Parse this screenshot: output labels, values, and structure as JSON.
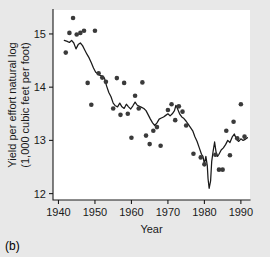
{
  "caption": "(b)",
  "chart_data": {
    "type": "scatter",
    "title": "",
    "xlabel": "Year",
    "ylabel": "Yield per effort natural log\n(1,000 cubic feet per foot)",
    "ylabel_line1": "Yield per effort natural log",
    "ylabel_line2": "(1,000 cubic feet per foot)",
    "xlim": [
      1938.5,
      1992.5
    ],
    "ylim": [
      11.88,
      15.45
    ],
    "xticks": [
      1940,
      1950,
      1960,
      1970,
      1980,
      1990
    ],
    "xtick_labels": [
      "1940",
      "1950",
      "1960",
      "1970",
      "1980",
      "1990"
    ],
    "yticks": [
      12,
      13,
      14,
      15
    ],
    "ytick_labels": [
      "12",
      "13",
      "14",
      "15"
    ],
    "grid": false,
    "legend": "none",
    "series": [
      {
        "name": "Observed yield per effort",
        "type": "scatter",
        "marker": "filled-circle",
        "color": "#3a3a3a",
        "points": [
          [
            1942,
            14.65
          ],
          [
            1943,
            15.02
          ],
          [
            1944,
            15.3
          ],
          [
            1945,
            14.99
          ],
          [
            1946,
            15.02
          ],
          [
            1947,
            15.06
          ],
          [
            1948,
            14.08
          ],
          [
            1949,
            13.67
          ],
          [
            1950,
            15.06
          ],
          [
            1951,
            14.26
          ],
          [
            1952,
            14.18
          ],
          [
            1953,
            14.1
          ],
          [
            1955,
            13.6
          ],
          [
            1956,
            14.17
          ],
          [
            1957,
            13.48
          ],
          [
            1958,
            14.08
          ],
          [
            1959,
            13.5
          ],
          [
            1960,
            13.05
          ],
          [
            1961,
            13.84
          ],
          [
            1962,
            13.6
          ],
          [
            1963,
            14.09
          ],
          [
            1964,
            13.09
          ],
          [
            1965,
            12.93
          ],
          [
            1966,
            13.18
          ],
          [
            1967,
            13.25
          ],
          [
            1968,
            12.9
          ],
          [
            1970,
            13.57
          ],
          [
            1971,
            13.68
          ],
          [
            1972,
            13.38
          ],
          [
            1973,
            13.64
          ],
          [
            1974,
            13.54
          ],
          [
            1975,
            13.28
          ],
          [
            1977,
            12.75
          ],
          [
            1979,
            12.68
          ],
          [
            1980,
            12.55
          ],
          [
            1983,
            12.73
          ],
          [
            1984,
            12.45
          ],
          [
            1985,
            12.45
          ],
          [
            1986,
            13.18
          ],
          [
            1987,
            12.72
          ],
          [
            1988,
            13.35
          ],
          [
            1989,
            13.04
          ],
          [
            1990,
            13.68
          ],
          [
            1991,
            13.07
          ]
        ]
      },
      {
        "name": "Smoothed trend",
        "type": "line",
        "color": "#1a1a1a",
        "points": [
          [
            1941.6,
            14.88
          ],
          [
            1942.4,
            14.86
          ],
          [
            1943.0,
            14.84
          ],
          [
            1943.6,
            14.88
          ],
          [
            1944.2,
            14.83
          ],
          [
            1944.8,
            14.72
          ],
          [
            1945.4,
            14.8
          ],
          [
            1946.0,
            14.83
          ],
          [
            1946.6,
            14.78
          ],
          [
            1947.2,
            14.7
          ],
          [
            1947.8,
            14.62
          ],
          [
            1948.4,
            14.55
          ],
          [
            1949.0,
            14.46
          ],
          [
            1949.6,
            14.36
          ],
          [
            1950.2,
            14.28
          ],
          [
            1950.8,
            14.26
          ],
          [
            1951.4,
            14.22
          ],
          [
            1952.0,
            14.21
          ],
          [
            1952.6,
            14.17
          ],
          [
            1953.2,
            14.02
          ],
          [
            1953.8,
            13.9
          ],
          [
            1954.4,
            13.82
          ],
          [
            1955.0,
            13.7
          ],
          [
            1955.6,
            13.65
          ],
          [
            1956.2,
            13.63
          ],
          [
            1956.8,
            13.7
          ],
          [
            1957.4,
            13.63
          ],
          [
            1958.0,
            13.6
          ],
          [
            1958.6,
            13.68
          ],
          [
            1959.2,
            13.63
          ],
          [
            1959.8,
            13.59
          ],
          [
            1960.4,
            13.65
          ],
          [
            1961.0,
            13.72
          ],
          [
            1961.6,
            13.66
          ],
          [
            1962.2,
            13.64
          ],
          [
            1962.8,
            13.62
          ],
          [
            1963.4,
            13.6
          ],
          [
            1964.0,
            13.56
          ],
          [
            1964.6,
            13.48
          ],
          [
            1965.2,
            13.4
          ],
          [
            1965.8,
            13.33
          ],
          [
            1966.4,
            13.28
          ],
          [
            1967.0,
            13.33
          ],
          [
            1967.6,
            13.4
          ],
          [
            1968.2,
            13.42
          ],
          [
            1968.8,
            13.44
          ],
          [
            1969.4,
            13.47
          ],
          [
            1970.0,
            13.5
          ],
          [
            1970.6,
            13.46
          ],
          [
            1971.2,
            13.5
          ],
          [
            1971.8,
            13.56
          ],
          [
            1972.2,
            13.66
          ],
          [
            1972.6,
            13.6
          ],
          [
            1973.2,
            13.5
          ],
          [
            1973.8,
            13.44
          ],
          [
            1974.4,
            13.41
          ],
          [
            1975.0,
            13.36
          ],
          [
            1975.6,
            13.3
          ],
          [
            1976.2,
            13.24
          ],
          [
            1976.8,
            13.18
          ],
          [
            1977.4,
            13.07
          ],
          [
            1978.0,
            12.98
          ],
          [
            1978.6,
            12.86
          ],
          [
            1979.2,
            12.74
          ],
          [
            1979.6,
            12.7
          ],
          [
            1980.0,
            12.56
          ],
          [
            1980.4,
            12.7
          ],
          [
            1980.8,
            12.52
          ],
          [
            1981.0,
            12.28
          ],
          [
            1981.3,
            12.1
          ],
          [
            1981.7,
            12.24
          ],
          [
            1982.0,
            12.6
          ],
          [
            1982.4,
            12.8
          ],
          [
            1982.8,
            12.97
          ],
          [
            1983.2,
            12.78
          ],
          [
            1983.6,
            12.7
          ],
          [
            1984.0,
            12.74
          ],
          [
            1984.6,
            12.82
          ],
          [
            1985.2,
            12.86
          ],
          [
            1985.8,
            12.92
          ],
          [
            1986.4,
            13.0
          ],
          [
            1987.0,
            12.96
          ],
          [
            1987.6,
            13.06
          ],
          [
            1988.2,
            13.12
          ],
          [
            1988.8,
            13.02
          ],
          [
            1989.4,
            12.98
          ],
          [
            1990.0,
            13.03
          ],
          [
            1990.6,
            13.0
          ],
          [
            1991.2,
            13.02
          ],
          [
            1991.8,
            13.05
          ]
        ]
      }
    ]
  }
}
